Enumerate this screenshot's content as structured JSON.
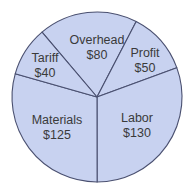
{
  "chart_data": {
    "type": "pie",
    "title": "",
    "slices": [
      {
        "label": "Overhead",
        "value": 80,
        "display": "$80"
      },
      {
        "label": "Profit",
        "value": 50,
        "display": "$50"
      },
      {
        "label": "Labor",
        "value": 130,
        "display": "$130"
      },
      {
        "label": "Materials",
        "value": 125,
        "display": "$125"
      },
      {
        "label": "Tariff",
        "value": 40,
        "display": "$40"
      }
    ],
    "categories": [
      "Overhead",
      "Profit",
      "Labor",
      "Materials",
      "Tariff"
    ],
    "values": [
      80,
      50,
      130,
      125,
      40
    ],
    "total": 425,
    "start_angle_deg": -40.3,
    "direction": "clockwise",
    "legend": "none (inline labels)",
    "colors": {
      "fill": "#c8d2f0",
      "stroke": "#4a5070",
      "text": "#3a3a3a"
    }
  },
  "labels": {
    "overhead": {
      "name": "Overhead",
      "value": "$80"
    },
    "profit": {
      "name": "Profit",
      "value": "$50"
    },
    "labor": {
      "name": "Labor",
      "value": "$130"
    },
    "materials": {
      "name": "Materials",
      "value": "$125"
    },
    "tariff": {
      "name": "Tariff",
      "value": "$40"
    }
  }
}
